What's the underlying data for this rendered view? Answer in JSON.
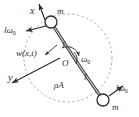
{
  "figure": {
    "type": "mechanical-schematic",
    "canvas": {
      "width": 139,
      "height": 117,
      "background": "#ffffff"
    }
  },
  "colors": {
    "stroke": "#2b2b2b",
    "beam_fill": "#b9b9b9",
    "dashed_circle": "#9a9a9a",
    "text": "#2b2b2b",
    "mass_fill": "#ffffff"
  },
  "labels": {
    "axis_x": "x",
    "axis_y": "y",
    "mass_top": "m",
    "mass_bottom": "m",
    "tip_speed_top": "lω",
    "tip_speed_top_sub": "0",
    "tip_speed_bottom": "lω",
    "tip_speed_bottom_sub": "0",
    "deflection": "w(x,t)",
    "length_upper": "l",
    "length_lower": "l",
    "hub": "O",
    "angular_velocity": "ω",
    "angular_velocity_sub": "0",
    "beam_property": "ρA"
  },
  "geometry": {
    "hub": {
      "x": 68,
      "y": 58
    },
    "mass_top": {
      "x": 51,
      "y": 22,
      "r": 6
    },
    "mass_bottom": {
      "x": 103,
      "y": 100,
      "r": 6
    },
    "orbit_circle": {
      "cx": 68,
      "cy": 58,
      "r": 44,
      "dashed": true
    },
    "axis_x_arrow": {
      "x1": 44,
      "y1": 19,
      "x2": 38,
      "y2": 3
    },
    "axis_y_arrow": {
      "x1": 60,
      "y1": 58,
      "x2": 10,
      "y2": 84
    },
    "tip_arrow_top": {
      "x1": 45,
      "y1": 26,
      "x2": 24,
      "y2": 31
    },
    "tip_arrow_bottom": {
      "x1": 110,
      "y1": 96,
      "x2": 124,
      "y2": 85
    },
    "deflection_arrow": {
      "x1": 56,
      "y1": 46,
      "x2": 44,
      "y2": 55
    },
    "spin_arc": {
      "cx": 68,
      "cy": 58,
      "r": 11,
      "start_deg": 120,
      "end_deg": 0
    },
    "beam_path": "M 51 22 Q 72 56 103 100"
  },
  "label_positions": {
    "axis_x": {
      "x": 30,
      "y": 13
    },
    "axis_y": {
      "x": 9,
      "y": 80
    },
    "mass_top": {
      "x": 58,
      "y": 14
    },
    "mass_bottom": {
      "x": 113,
      "y": 109
    },
    "tip_speed_top": {
      "x": 5,
      "y": 32
    },
    "tip_speed_bottom": {
      "x": 118,
      "y": 90
    },
    "deflection": {
      "x": 17,
      "y": 55
    },
    "length_upper": {
      "x": 62,
      "y": 47
    },
    "length_lower": {
      "x": 84,
      "y": 79
    },
    "hub": {
      "x": 63,
      "y": 65
    },
    "angular_velocity": {
      "x": 82,
      "y": 61
    },
    "beam_property": {
      "x": 55,
      "y": 87
    }
  }
}
